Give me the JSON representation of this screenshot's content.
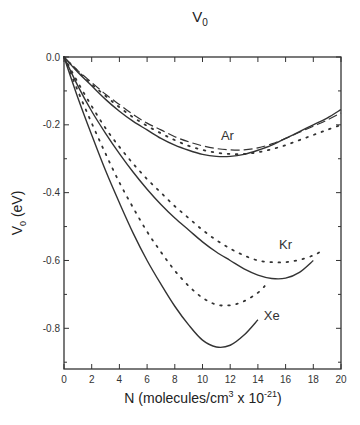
{
  "chart_data": {
    "type": "line",
    "title": "V",
    "title_subscript": "0",
    "xlabel": "N (molecules/cm",
    "xlabel_sup": "3",
    "xlabel_tail": " x 10",
    "xlabel_exp": "-21",
    "xlabel_close": ")",
    "ylabel": "V",
    "ylabel_subscript": "0",
    "ylabel_tail": " (eV)",
    "xlim": [
      0,
      20
    ],
    "ylim": [
      -0.92,
      0.0
    ],
    "xticks": [
      0,
      2,
      4,
      6,
      8,
      10,
      12,
      14,
      16,
      18,
      20
    ],
    "xtick_labels": [
      "0",
      "2",
      "4",
      "6",
      "8",
      "10",
      "12",
      "14",
      "16",
      "18",
      "20"
    ],
    "yticks": [
      0.0,
      -0.2,
      -0.4,
      -0.6,
      -0.8
    ],
    "ytick_labels": [
      "0.0",
      "-0.2",
      "-0.4",
      "-0.6",
      "-0.8"
    ],
    "grid": false,
    "legend": "none (inline curve labels)",
    "annotations": [
      {
        "text": "Ar",
        "x": 11.8,
        "y": -0.245
      },
      {
        "text": "Kr",
        "x": 16.0,
        "y": -0.565
      },
      {
        "text": "Xe",
        "x": 15.0,
        "y": -0.775
      }
    ],
    "series": [
      {
        "name": "Ar (solid)",
        "style": "solid",
        "x": [
          0,
          1,
          2,
          3,
          4,
          5,
          6,
          7,
          8,
          9,
          10,
          11,
          12,
          13,
          14,
          15,
          16,
          17,
          18,
          19,
          20
        ],
        "y": [
          0,
          -0.045,
          -0.085,
          -0.125,
          -0.16,
          -0.19,
          -0.215,
          -0.24,
          -0.26,
          -0.275,
          -0.287,
          -0.293,
          -0.293,
          -0.287,
          -0.275,
          -0.26,
          -0.24,
          -0.22,
          -0.2,
          -0.18,
          -0.155
        ]
      },
      {
        "name": "Ar (dashed)",
        "style": "dashed",
        "x": [
          0,
          1,
          2,
          3,
          4,
          5,
          6,
          7,
          8,
          9,
          10,
          11,
          12,
          13,
          14,
          15,
          16,
          17,
          18,
          19,
          20
        ],
        "y": [
          0,
          -0.04,
          -0.075,
          -0.11,
          -0.14,
          -0.17,
          -0.195,
          -0.215,
          -0.235,
          -0.25,
          -0.262,
          -0.27,
          -0.274,
          -0.274,
          -0.268,
          -0.256,
          -0.24,
          -0.222,
          -0.204,
          -0.186,
          -0.165
        ]
      },
      {
        "name": "Ar (dotted)",
        "style": "dotted",
        "x": [
          0,
          1,
          2,
          3,
          4,
          5,
          6,
          7,
          8,
          9,
          10,
          11,
          12,
          13,
          14,
          15,
          16,
          17,
          18,
          19,
          20
        ],
        "y": [
          0,
          -0.042,
          -0.08,
          -0.115,
          -0.148,
          -0.178,
          -0.203,
          -0.225,
          -0.245,
          -0.262,
          -0.274,
          -0.282,
          -0.286,
          -0.286,
          -0.281,
          -0.272,
          -0.26,
          -0.245,
          -0.23,
          -0.215,
          -0.2
        ]
      },
      {
        "name": "Kr (solid)",
        "style": "solid",
        "x": [
          0,
          1,
          2,
          3,
          4,
          5,
          6,
          7,
          8,
          9,
          10,
          11,
          12,
          13,
          14,
          15,
          16,
          17,
          18
        ],
        "y": [
          0,
          -0.085,
          -0.16,
          -0.225,
          -0.285,
          -0.34,
          -0.39,
          -0.435,
          -0.475,
          -0.51,
          -0.545,
          -0.575,
          -0.6,
          -0.625,
          -0.643,
          -0.653,
          -0.652,
          -0.635,
          -0.6
        ]
      },
      {
        "name": "Kr (dotted)",
        "style": "dotted",
        "x": [
          0,
          1,
          2,
          3,
          4,
          5,
          6,
          7,
          8,
          9,
          10,
          11,
          12,
          13,
          14,
          15,
          16,
          17,
          18,
          18.7
        ],
        "y": [
          0,
          -0.075,
          -0.145,
          -0.21,
          -0.265,
          -0.315,
          -0.36,
          -0.4,
          -0.44,
          -0.475,
          -0.51,
          -0.54,
          -0.565,
          -0.585,
          -0.6,
          -0.605,
          -0.605,
          -0.598,
          -0.585,
          -0.57
        ]
      },
      {
        "name": "Xe (solid)",
        "style": "solid",
        "x": [
          0,
          1,
          2,
          3,
          4,
          5,
          6,
          7,
          8,
          9,
          10,
          11,
          12,
          13,
          14
        ],
        "y": [
          0,
          -0.12,
          -0.23,
          -0.335,
          -0.43,
          -0.52,
          -0.6,
          -0.67,
          -0.735,
          -0.79,
          -0.835,
          -0.855,
          -0.85,
          -0.82,
          -0.775
        ]
      },
      {
        "name": "Xe (dotted)",
        "style": "dotted",
        "x": [
          0,
          1,
          2,
          3,
          4,
          5,
          6,
          7,
          8,
          9,
          10,
          11,
          12,
          13,
          14,
          14.5
        ],
        "y": [
          0,
          -0.1,
          -0.195,
          -0.285,
          -0.37,
          -0.445,
          -0.515,
          -0.575,
          -0.63,
          -0.675,
          -0.71,
          -0.73,
          -0.732,
          -0.72,
          -0.695,
          -0.675
        ]
      }
    ]
  }
}
